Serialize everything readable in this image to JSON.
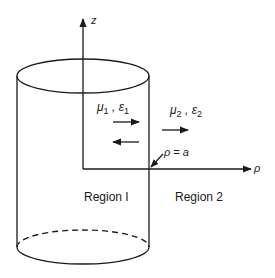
{
  "figure": {
    "background": "#ffffff",
    "stroke_color": "#1a1a1a",
    "axes": {
      "z_label": "z",
      "rho_label": "ρ"
    },
    "boundary_label": "ρ = a",
    "region1": {
      "label": "Region I",
      "mu": "μ",
      "mu_sub": "1",
      "eps": "ε",
      "eps_sub": "1",
      "separator": ","
    },
    "region2": {
      "label": "Region 2",
      "mu": "μ",
      "mu_sub": "2",
      "eps": "ε",
      "eps_sub": "2",
      "separator": ","
    },
    "arrows": [
      {
        "name": "incident-wave-arrow",
        "direction": "right",
        "region": "1"
      },
      {
        "name": "reflected-wave-arrow",
        "direction": "left",
        "region": "1"
      },
      {
        "name": "transmitted-wave-arrow",
        "direction": "right",
        "region": "2"
      }
    ],
    "cylinder": {
      "top_ellipse": "solid",
      "bottom_ellipse_back": "dashed",
      "bottom_ellipse_front": "solid"
    }
  }
}
